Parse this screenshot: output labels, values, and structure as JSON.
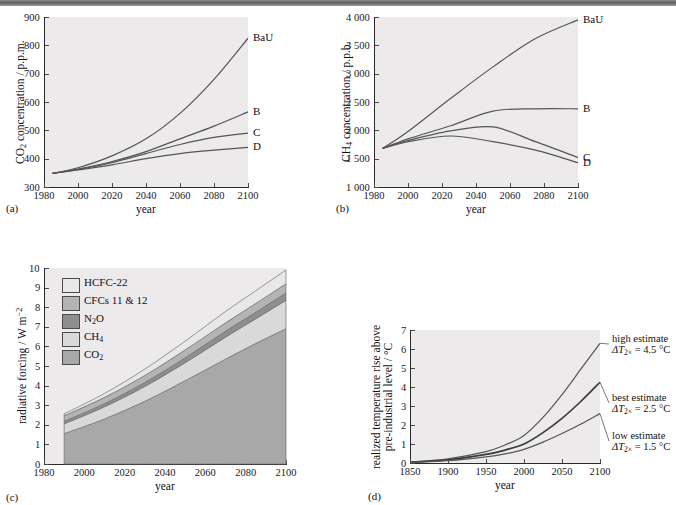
{
  "figure": {
    "panels": [
      {
        "tag": "(a)",
        "xlabel": "year",
        "ylabel_prefix": "CO",
        "ylabel_sub": "2",
        "ylabel_suffix": " concentration / p.p.m."
      },
      {
        "tag": "(b)",
        "xlabel": "year",
        "ylabel_prefix": "CH",
        "ylabel_sub": "4",
        "ylabel_suffix": " concentration / p.p.b."
      },
      {
        "tag": "(c)",
        "xlabel": "year",
        "ylabel": "radiative forcing / W m"
      },
      {
        "tag": "(d)",
        "xlabel": "year",
        "ylabel_line1": "realized temperature rise above",
        "ylabel_line2": "pre-industrial level / °C"
      }
    ]
  },
  "chart_data": [
    {
      "type": "line",
      "panel": "a",
      "title": "",
      "xlabel": "year",
      "ylabel": "CO2 concentration / p.p.m.",
      "xlim": [
        1980,
        2100
      ],
      "ylim": [
        300,
        900
      ],
      "xticks": [
        1980,
        2000,
        2020,
        2040,
        2060,
        2080,
        2100
      ],
      "yticks": [
        300,
        400,
        500,
        600,
        700,
        800,
        900
      ],
      "xticklabels": [
        "1980",
        "2000",
        "2020",
        "2040",
        "2060",
        "2080",
        "2100"
      ],
      "yticklabels": [
        "300",
        "400",
        "500",
        "600",
        "700",
        "800",
        "900"
      ],
      "grid": false,
      "legend": "inline-right-end-labels",
      "x": [
        1985,
        2000,
        2020,
        2040,
        2060,
        2080,
        2100
      ],
      "series": [
        {
          "name": "BaU",
          "values": [
            348,
            368,
            410,
            470,
            560,
            680,
            825
          ]
        },
        {
          "name": "B",
          "values": [
            348,
            363,
            390,
            425,
            470,
            515,
            565
          ]
        },
        {
          "name": "C",
          "values": [
            348,
            362,
            386,
            418,
            450,
            475,
            490
          ]
        },
        {
          "name": "D",
          "values": [
            348,
            360,
            378,
            400,
            418,
            430,
            440
          ]
        }
      ]
    },
    {
      "type": "line",
      "panel": "b",
      "title": "",
      "xlabel": "year",
      "ylabel": "CH4 concentration / p.p.b.",
      "xlim": [
        1980,
        2100
      ],
      "ylim": [
        1000,
        4000
      ],
      "xticks": [
        1980,
        2000,
        2020,
        2040,
        2060,
        2080,
        2100
      ],
      "yticks": [
        1000,
        1500,
        2000,
        2500,
        3000,
        3500,
        4000
      ],
      "xticklabels": [
        "1980",
        "2000",
        "2020",
        "2040",
        "2060",
        "2080",
        "2100"
      ],
      "yticklabels": [
        "1 000",
        "1 500",
        "2 000",
        "2 500",
        "3 000",
        "3 500",
        "4 000"
      ],
      "grid": false,
      "legend": "inline-right-end-labels",
      "x": [
        1985,
        2000,
        2025,
        2050,
        2075,
        2100
      ],
      "series": [
        {
          "name": "BaU",
          "values": [
            1680,
            1980,
            2560,
            3120,
            3620,
            3950
          ]
        },
        {
          "name": "B",
          "values": [
            1680,
            1850,
            2080,
            2340,
            2380,
            2380
          ]
        },
        {
          "name": "C",
          "values": [
            1680,
            1820,
            1990,
            2060,
            1800,
            1520
          ]
        },
        {
          "name": "D",
          "values": [
            1680,
            1800,
            1900,
            1800,
            1650,
            1430
          ]
        }
      ]
    },
    {
      "type": "area",
      "panel": "c",
      "title": "",
      "xlabel": "year",
      "ylabel": "radiative forcing / W m-2",
      "xlim": [
        1980,
        2100
      ],
      "ylim": [
        0,
        10
      ],
      "xticks": [
        1980,
        2000,
        2020,
        2040,
        2060,
        2080,
        2100
      ],
      "yticks": [
        0,
        1,
        2,
        3,
        4,
        5,
        6,
        7,
        8,
        9,
        10
      ],
      "xticklabels": [
        "1980",
        "2000",
        "2020",
        "2040",
        "2060",
        "2080",
        "2100"
      ],
      "yticklabels": [
        "0",
        "1",
        "2",
        "3",
        "4",
        "5",
        "6",
        "7",
        "8",
        "9",
        "10"
      ],
      "grid": false,
      "stacked": true,
      "data_start_year": 1990,
      "legend_position": "upper-left-inside",
      "x": [
        1990,
        2010,
        2030,
        2050,
        2070,
        2085,
        2100
      ],
      "series": [
        {
          "name": "CO2",
          "legend_label": "CO2",
          "color": "#a8a8a8",
          "values": [
            1.55,
            2.3,
            3.2,
            4.25,
            5.35,
            6.15,
            6.9
          ]
        },
        {
          "name": "CH4",
          "legend_label": "CH4",
          "color": "#d9d9d9",
          "values": [
            0.5,
            0.62,
            0.76,
            0.92,
            1.12,
            1.26,
            1.45
          ]
        },
        {
          "name": "N2O",
          "legend_label": "N2O",
          "color": "#8e8e8e",
          "values": [
            0.13,
            0.16,
            0.2,
            0.25,
            0.3,
            0.33,
            0.38
          ]
        },
        {
          "name": "CFCs 11 & 12",
          "legend_label": "CFCs 11 & 12",
          "color": "#b4b4b4",
          "values": [
            0.28,
            0.32,
            0.36,
            0.4,
            0.43,
            0.45,
            0.47
          ]
        },
        {
          "name": "HCFC-22",
          "legend_label": "HCFC-22",
          "color": "#e8e8e8",
          "values": [
            0.1,
            0.2,
            0.32,
            0.45,
            0.58,
            0.65,
            0.7
          ]
        }
      ],
      "legend_order": [
        "HCFC-22",
        "CFCs 11 & 12",
        "N2O",
        "CH4",
        "CO2"
      ]
    },
    {
      "type": "line",
      "panel": "d",
      "title": "",
      "xlabel": "year",
      "ylabel": "realized temperature rise above pre-industrial level / °C",
      "xlim": [
        1850,
        2100
      ],
      "ylim": [
        0,
        7
      ],
      "xticks": [
        1850,
        1900,
        1950,
        2000,
        2050,
        2100
      ],
      "yticks": [
        0,
        1,
        2,
        3,
        4,
        5,
        6,
        7
      ],
      "xticklabels": [
        "1850",
        "1900",
        "1950",
        "2000",
        "2050",
        "2100"
      ],
      "yticklabels": [
        "0",
        "1",
        "2",
        "3",
        "4",
        "5",
        "6",
        "7"
      ],
      "grid": false,
      "legend": "right-side-annotations",
      "x": [
        1850,
        1900,
        1950,
        1975,
        2000,
        2025,
        2050,
        2075,
        2100
      ],
      "series": [
        {
          "name": "high estimate",
          "annotation_line1": "high estimate",
          "annotation_line2_prefix": "ΔT",
          "annotation_line2_sub": "2×",
          "annotation_line2_value": " = 4.5 °C",
          "values": [
            0.05,
            0.22,
            0.6,
            0.95,
            1.45,
            2.4,
            3.6,
            4.95,
            6.3
          ]
        },
        {
          "name": "best estimate",
          "annotation_line1": "best estimate",
          "annotation_line2_prefix": "ΔT",
          "annotation_line2_sub": "2×",
          "annotation_line2_value": " = 2.5 °C",
          "values": [
            0.04,
            0.16,
            0.45,
            0.68,
            1.0,
            1.6,
            2.35,
            3.25,
            4.25
          ]
        },
        {
          "name": "low estimate",
          "annotation_line1": "low estimate",
          "annotation_line2_prefix": "ΔT",
          "annotation_line2_sub": "2×",
          "annotation_line2_value": " = 1.5 °C",
          "values": [
            0.03,
            0.12,
            0.32,
            0.48,
            0.72,
            1.1,
            1.55,
            2.05,
            2.6
          ]
        }
      ]
    }
  ]
}
